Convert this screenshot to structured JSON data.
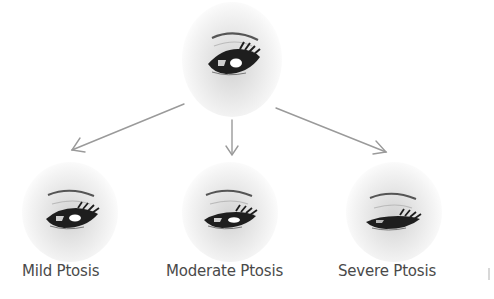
{
  "diagram": {
    "root": {
      "id": "normal-eye",
      "icon": "eye-open-icon"
    },
    "children": [
      {
        "id": "mild",
        "label": "Mild Ptosis",
        "icon": "eye-mild-ptosis-icon"
      },
      {
        "id": "moderate",
        "label": "Moderate Ptosis",
        "icon": "eye-moderate-ptosis-icon"
      },
      {
        "id": "severe",
        "label": "Severe Ptosis",
        "icon": "eye-severe-ptosis-icon"
      }
    ],
    "edges": [
      {
        "from": "normal-eye",
        "to": "mild"
      },
      {
        "from": "normal-eye",
        "to": "moderate"
      },
      {
        "from": "normal-eye",
        "to": "severe"
      }
    ],
    "colors": {
      "arrow": "#9a9a9a",
      "label": "#4a4a4a",
      "iris": "#1e1e1e",
      "brow": "#555555"
    }
  }
}
